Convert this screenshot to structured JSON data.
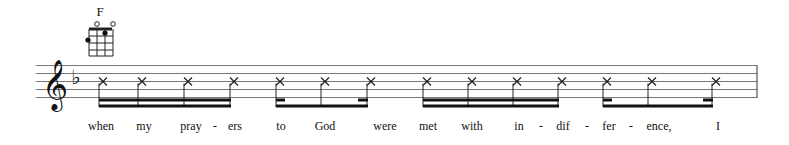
{
  "chord": {
    "name": "F"
  },
  "staff": {
    "clef": "treble",
    "key_signature": "F major (1 flat)",
    "line_color": "#777777"
  },
  "notes": {
    "notehead": "x-notehead",
    "groups": [
      {
        "type": "four-sixteenths",
        "x": [
          103,
          142,
          188,
          234
        ]
      },
      {
        "type": "sixteenth-eighth-sixteenth",
        "x": [
          280,
          325,
          371
        ]
      },
      {
        "type": "four-sixteenths",
        "x": [
          427,
          472,
          517,
          562
        ]
      },
      {
        "type": "sixteenth-eighth-sixteenth",
        "x": [
          607,
          652,
          716
        ]
      }
    ]
  },
  "lyrics": [
    {
      "text": "when",
      "x": 101
    },
    {
      "text": "my",
      "x": 144
    },
    {
      "text": "pray",
      "x": 191
    },
    {
      "text": "-",
      "x": 215
    },
    {
      "text": "ers",
      "x": 235
    },
    {
      "text": "to",
      "x": 281
    },
    {
      "text": "God",
      "x": 325
    },
    {
      "text": "were",
      "x": 385
    },
    {
      "text": "met",
      "x": 428
    },
    {
      "text": "with",
      "x": 472
    },
    {
      "text": "in",
      "x": 519
    },
    {
      "text": "-",
      "x": 541
    },
    {
      "text": "dif",
      "x": 563
    },
    {
      "text": "-",
      "x": 587
    },
    {
      "text": "fer",
      "x": 609
    },
    {
      "text": "-",
      "x": 631
    },
    {
      "text": "ence,",
      "x": 659
    },
    {
      "text": "I",
      "x": 718
    }
  ]
}
